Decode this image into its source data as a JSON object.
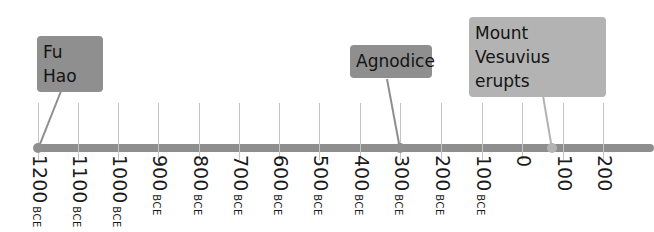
{
  "timeline": {
    "axis_color": "#8e8e8e",
    "ticks": [
      {
        "num": "1200",
        "era": "BCE",
        "x": 38
      },
      {
        "num": "1100",
        "era": "BCE",
        "x": 78
      },
      {
        "num": "1000",
        "era": "BCE",
        "x": 118
      },
      {
        "num": "900",
        "era": "BCE",
        "x": 158
      },
      {
        "num": "800",
        "era": "BCE",
        "x": 199
      },
      {
        "num": "700",
        "era": "BCE",
        "x": 239
      },
      {
        "num": "600",
        "era": "BCE",
        "x": 279
      },
      {
        "num": "500",
        "era": "BCE",
        "x": 319
      },
      {
        "num": "400",
        "era": "BCE",
        "x": 360
      },
      {
        "num": "300",
        "era": "BCE",
        "x": 400
      },
      {
        "num": "200",
        "era": "BCE",
        "x": 441
      },
      {
        "num": "100",
        "era": "BCE",
        "x": 482
      },
      {
        "num": "0",
        "era": "",
        "x": 522
      },
      {
        "num": "100",
        "era": "",
        "x": 563
      },
      {
        "num": "200",
        "era": "",
        "x": 603
      }
    ],
    "events": [
      {
        "label": "Fu Hao",
        "color": "#8f8f8f",
        "box": {
          "left": 37,
          "top": 36,
          "width": 66,
          "height": 34
        },
        "anchor": {
          "x": 69,
          "y": 70
        },
        "point": {
          "x": 38,
          "y": 148
        }
      },
      {
        "label": "Agnodice",
        "color": "#8f8f8f",
        "box": {
          "left": 350,
          "top": 45,
          "width": 82,
          "height": 33
        },
        "anchor": {
          "x": 387,
          "y": 78
        },
        "point": {
          "x": 400,
          "y": 148
        }
      },
      {
        "label": "Mount Vesuvius erupts",
        "color": "#b3b3b3",
        "box": {
          "left": 469,
          "top": 17,
          "width": 137,
          "height": 60
        },
        "anchor": {
          "x": 540,
          "y": 77
        },
        "point": {
          "x": 552,
          "y": 148
        }
      }
    ]
  }
}
